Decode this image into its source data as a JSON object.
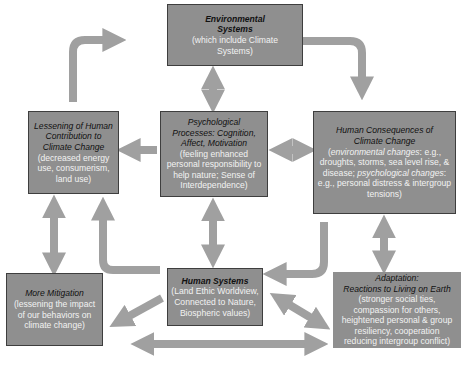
{
  "diagram": {
    "colors": {
      "box_fill": "#8f8f8f",
      "box_border": "#3e3e3e",
      "arrow": "#a0a0a0",
      "title_text": "#111111",
      "desc_text": "#f2f2f2"
    },
    "nodes": {
      "environmental_systems": {
        "title_line1": "Environmental",
        "title_line2": "Systems",
        "desc": "(which include Climate Systems)"
      },
      "lessening": {
        "title": "Lessening of Human Contribution to Climate Change",
        "desc": "(decreased energy use, consumerism, land use)"
      },
      "psychological_processes": {
        "title": "Psychological Processes: Cognition, Affect, Motivation",
        "desc": "(feeling enhanced personal responsibility to help nature; Sense of Interdependence)"
      },
      "human_consequences": {
        "title": "Human Consequences of Climate Change",
        "desc_open": "(",
        "desc_env_label": "environmental changes",
        "desc_env": ": e.g., droughts, storms, sea level rise, & disease; ",
        "desc_psy_label": "psychological changes",
        "desc_psy": ": e.g., personal distress & intergroup tensions)"
      },
      "more_mitigation": {
        "title": "More Mitigation",
        "desc": "(lessening the impact of our behaviors on climate change)"
      },
      "human_systems": {
        "title": "Human Systems",
        "desc": "(Land Ethic Worldview, Connected to Nature, Biospheric values)"
      },
      "adaptation": {
        "title_line1": "Adaptation:",
        "title_line2": "Reactions to Living on Earth",
        "desc": "(stronger social ties, compassion for others, heightened personal & group resiliency, cooperation reducing intergroup conflict)"
      }
    },
    "edges": [
      {
        "from": "lessening",
        "to": "environmental_systems",
        "type": "curved-one-way"
      },
      {
        "from": "environmental_systems",
        "to": "human_consequences",
        "type": "curved-one-way"
      },
      {
        "from": "environmental_systems",
        "to": "psychological_processes",
        "type": "two-way"
      },
      {
        "from": "psychological_processes",
        "to": "lessening",
        "type": "one-way"
      },
      {
        "from": "psychological_processes",
        "to": "human_consequences",
        "type": "two-way"
      },
      {
        "from": "psychological_processes",
        "to": "human_systems",
        "type": "two-way"
      },
      {
        "from": "lessening",
        "to": "more_mitigation",
        "type": "two-way"
      },
      {
        "from": "human_systems",
        "to": "lessening",
        "type": "curved-one-way"
      },
      {
        "from": "human_consequences",
        "to": "human_systems",
        "type": "curved-one-way"
      },
      {
        "from": "human_consequences",
        "to": "adaptation",
        "type": "two-way"
      },
      {
        "from": "human_systems",
        "to": "more_mitigation",
        "type": "one-way"
      },
      {
        "from": "human_systems",
        "to": "adaptation",
        "type": "two-way"
      },
      {
        "from": "more_mitigation",
        "to": "adaptation",
        "type": "two-way"
      }
    ]
  }
}
